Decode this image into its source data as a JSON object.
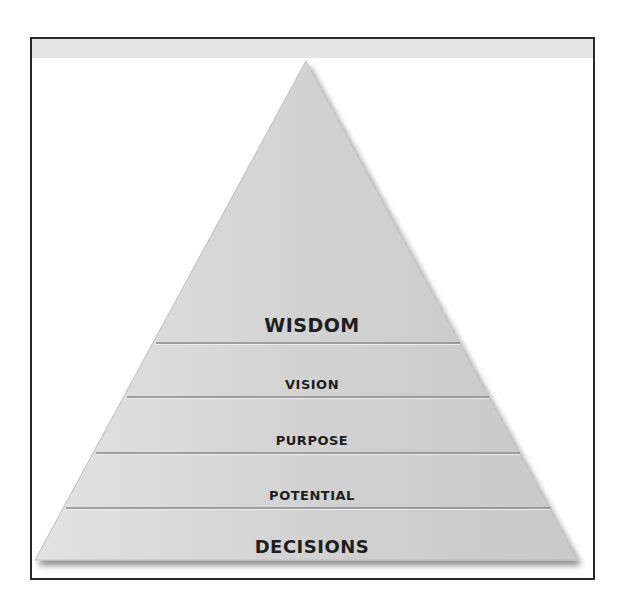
{
  "diagram": {
    "type": "pyramid",
    "levels": [
      {
        "label": "WISDOM",
        "position": "top"
      },
      {
        "label": "VISION"
      },
      {
        "label": "PURPOSE"
      },
      {
        "label": "POTENTIAL"
      },
      {
        "label": "DECISIONS",
        "position": "base"
      }
    ],
    "colors": {
      "fill": "#d3d3d3",
      "divider": "#8a8a8a",
      "text": "#1e1e1e",
      "frame": "#2a2a2a"
    }
  }
}
